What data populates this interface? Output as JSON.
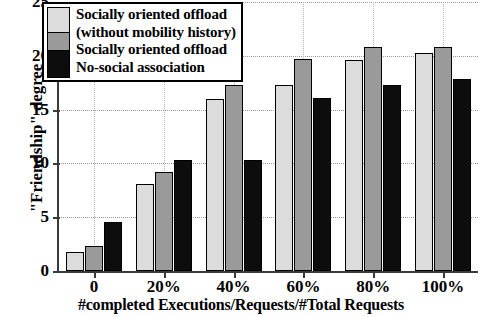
{
  "chart_data": {
    "type": "bar",
    "title": "",
    "xlabel": "#completed Executions/Requests/#Total Requests",
    "ylabel": "\"Friendship\" degree",
    "categories": [
      "0",
      "20%",
      "40%",
      "60%",
      "80%",
      "100%"
    ],
    "series": [
      {
        "name": "Socially oriented offload (without mobility history)",
        "color": "#dcdcdc",
        "values": [
          1.8,
          8.1,
          16.0,
          17.3,
          19.6,
          20.3
        ]
      },
      {
        "name": "Socially oriented offload",
        "color": "#9a9a9a",
        "values": [
          2.3,
          9.2,
          17.3,
          19.7,
          20.8,
          20.8
        ]
      },
      {
        "name": "No-social association",
        "color": "#0d0d0d",
        "values": [
          4.6,
          10.3,
          10.3,
          16.1,
          17.3,
          17.8
        ]
      }
    ],
    "ylim": [
      0,
      25
    ],
    "yticks": [
      0,
      5,
      10,
      15,
      20,
      25
    ],
    "ytick_labels": [
      "0",
      "5",
      "10",
      "15",
      "20",
      "25"
    ],
    "grid": true,
    "legend_position": "upper-left",
    "legend_lines": [
      "Socially oriented offload",
      "(without mobility history)",
      "Socially oriented offload",
      "No-social association"
    ]
  }
}
